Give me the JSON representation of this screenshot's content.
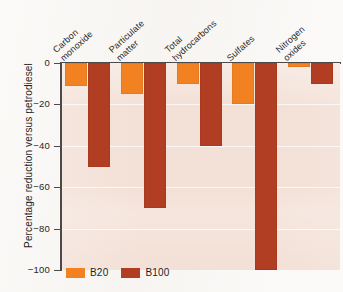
{
  "chart_data": {
    "type": "bar",
    "title": "",
    "subtitle": "",
    "xlabel": "",
    "ylabel": "Percentage reduction versus petrodiesel",
    "ylim": [
      -100,
      0
    ],
    "yticks": [
      0,
      -20,
      -40,
      -60,
      -80,
      -100
    ],
    "ytick_labels": [
      "0",
      "−20",
      "−40",
      "−60",
      "−80",
      "−100"
    ],
    "grid": true,
    "legend_position": "bottom-left",
    "categories": [
      "Carbon monoxide",
      "Particulate matter",
      "Total hydrocarbons",
      "Sulfates",
      "Nitrogen oxides"
    ],
    "category_lines": [
      [
        "Carbon",
        "monoxide"
      ],
      [
        "Particulate",
        "matter"
      ],
      [
        "Total",
        "hydrocarbons"
      ],
      [
        "Sulfates",
        ""
      ],
      [
        "Nitrogen",
        "oxides"
      ]
    ],
    "series": [
      {
        "name": "B20",
        "color": "#f28122",
        "values": [
          -11,
          -15,
          -10,
          -20,
          -2
        ]
      },
      {
        "name": "B100",
        "color": "#b13e22",
        "values": [
          -50,
          -70,
          -40,
          -100,
          -10
        ]
      }
    ],
    "annotations": []
  },
  "legend": {
    "items": [
      {
        "label": "B20",
        "color": "#f28122"
      },
      {
        "label": "B100",
        "color": "#b13e22"
      }
    ]
  },
  "colors": {
    "plot_background": "#f3e0d6",
    "axis": "#4a4a4a",
    "gridline": "#ffffff",
    "b20": "#f28122",
    "b100": "#b13e22",
    "page_background": "#fbfaf8"
  }
}
